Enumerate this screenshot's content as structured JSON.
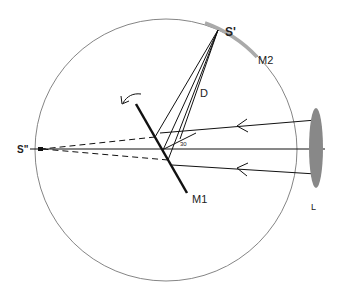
{
  "diagram": {
    "labels": {
      "s_prime": "S'",
      "s_double_prime": "S\"",
      "m1": "M1",
      "m2": "M2",
      "d": "D",
      "l": "L",
      "angle": "30"
    },
    "colors": {
      "ink": "#111111",
      "circle": "#777777",
      "mirror_m2": "#aaaaaa",
      "lens": "#888888"
    },
    "elements": [
      {
        "id": "circle",
        "desc": "large reference circle"
      },
      {
        "id": "m1",
        "desc": "rotating plane mirror M1 with curved rotation arrow"
      },
      {
        "id": "m2",
        "desc": "curved mirror M2 on circle arc"
      },
      {
        "id": "lens",
        "desc": "lens L (ellipse) on right"
      },
      {
        "id": "rays",
        "desc": "three incoming rays with arrowheads from lens to M1"
      },
      {
        "id": "reflected",
        "desc": "rays from M1 converging to S'"
      },
      {
        "id": "virtual",
        "desc": "dashed virtual rays extending to S\""
      }
    ]
  }
}
